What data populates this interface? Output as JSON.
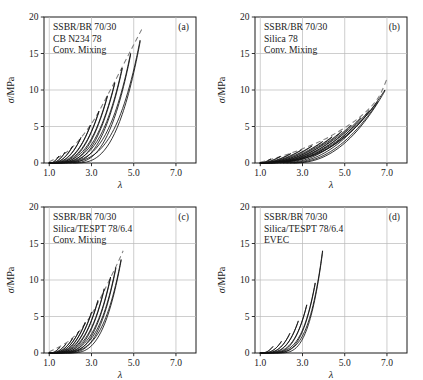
{
  "figure": {
    "background": "#ffffff",
    "curve_color": "#111111",
    "envelope_color": "#7d7d7d",
    "grid_color": "#b9b9b9",
    "frame_color": "#1a1a1a"
  },
  "axes": {
    "xlabel": "λ",
    "ylabel_symbol": "σ",
    "ylabel_unit": "/MPa",
    "xticks": [
      "1.0",
      "3.0",
      "5.0",
      "7.0"
    ],
    "xtick_values": [
      1.0,
      3.0,
      5.0,
      7.0
    ],
    "yticks": [
      "0",
      "5",
      "10",
      "15",
      "20"
    ],
    "ytick_values": [
      0,
      5,
      10,
      15,
      20
    ],
    "xlim": [
      0.75,
      7.95
    ],
    "ylim": [
      0,
      20
    ]
  },
  "chart_data": [
    {
      "type": "line",
      "panel": "a",
      "tag": "(a)",
      "title": "",
      "xlabel": "λ",
      "ylabel": "σ/MPa",
      "xlim": [
        0.75,
        7.95
      ],
      "ylim": [
        0,
        20
      ],
      "grid": true,
      "annotations": [
        "SSBR/BR 70/30",
        "CB N234 78",
        "Conv. Mixing"
      ],
      "legend": "none",
      "has_envelope": true,
      "envelope_note": "dashed grey envelope through loop tips",
      "cycle_peaks_lambda": [
        1.45,
        1.75,
        2.1,
        2.5,
        2.95,
        3.35,
        3.75,
        4.1,
        4.45,
        4.85,
        5.3
      ],
      "cycle_peaks_sigma": [
        0.95,
        1.5,
        2.3,
        3.5,
        5.2,
        7.1,
        9.2,
        11.0,
        13.0,
        15.0,
        16.8
      ],
      "envelope_x": [
        1.0,
        2.0,
        3.0,
        3.8,
        4.5,
        5.0,
        5.45
      ],
      "envelope_y": [
        0.15,
        1.9,
        5.4,
        9.5,
        13.4,
        16.2,
        18.7
      ]
    },
    {
      "type": "line",
      "panel": "b",
      "tag": "(b)",
      "title": "",
      "xlabel": "λ",
      "ylabel": "σ/MPa",
      "xlim": [
        0.75,
        7.95
      ],
      "ylim": [
        0,
        20
      ],
      "grid": true,
      "annotations": [
        "SSBR/BR 70/30",
        "Silica 78",
        "Conv. Mixing"
      ],
      "legend": "none",
      "has_envelope": true,
      "envelope_note": "dashed grey envelope through loop tips",
      "cycle_peaks_lambda": [
        1.5,
        1.95,
        2.45,
        2.95,
        3.45,
        3.95,
        4.4,
        4.85,
        5.3,
        5.75,
        6.15,
        6.55,
        6.9
      ],
      "cycle_peaks_sigma": [
        0.55,
        0.9,
        1.3,
        1.8,
        2.35,
        2.95,
        3.6,
        4.35,
        5.2,
        6.2,
        7.2,
        8.4,
        10.0
      ],
      "envelope_x": [
        1.0,
        2.5,
        4.0,
        5.2,
        6.0,
        6.6,
        7.0
      ],
      "envelope_y": [
        0.1,
        1.4,
        3.2,
        5.2,
        7.0,
        9.0,
        11.5
      ]
    },
    {
      "type": "line",
      "panel": "c",
      "tag": "(c)",
      "title": "",
      "xlabel": "λ",
      "ylabel": "σ/MPa",
      "xlim": [
        0.75,
        7.95
      ],
      "ylim": [
        0,
        20
      ],
      "grid": true,
      "annotations": [
        "SSBR/BR 70/30",
        "Silica/TESPT 78/6.4",
        "Conv. Mixing"
      ],
      "legend": "none",
      "has_envelope": true,
      "envelope_note": "dashed grey envelope through loop tips",
      "cycle_peaks_lambda": [
        1.5,
        1.8,
        2.1,
        2.4,
        2.7,
        3.0,
        3.3,
        3.6,
        3.9,
        4.15,
        4.4
      ],
      "cycle_peaks_sigma": [
        0.8,
        1.3,
        2.0,
        3.0,
        4.2,
        5.6,
        7.2,
        8.8,
        10.4,
        11.7,
        12.8
      ],
      "envelope_x": [
        1.0,
        2.0,
        2.8,
        3.4,
        3.9,
        4.25,
        4.5
      ],
      "envelope_y": [
        0.15,
        1.8,
        4.4,
        7.4,
        10.3,
        12.4,
        14.0
      ]
    },
    {
      "type": "line",
      "panel": "d",
      "tag": "(d)",
      "title": "",
      "xlabel": "λ",
      "ylabel": "σ/MPa",
      "xlim": [
        0.75,
        7.95
      ],
      "ylim": [
        0,
        20
      ],
      "grid": true,
      "annotations": [
        "SSBR/BR 70/30",
        "Silica/TESPT 78/6.4",
        "EVEC"
      ],
      "legend": "none",
      "has_envelope": false,
      "envelope_note": "",
      "cycle_peaks_lambda": [
        1.6,
        2.0,
        2.4,
        2.8,
        3.2,
        3.6,
        3.95
      ],
      "cycle_peaks_sigma": [
        0.9,
        1.6,
        2.7,
        4.4,
        6.6,
        9.6,
        14.0
      ],
      "envelope_x": [],
      "envelope_y": []
    }
  ]
}
